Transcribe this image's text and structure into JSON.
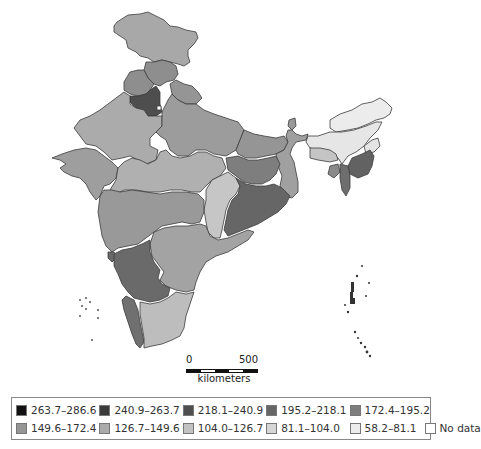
{
  "map": {
    "title": "",
    "region": "India",
    "states": [
      {
        "name": "Jammu and Kashmir",
        "class": "126.7-149.6",
        "color": "#a8a8a8"
      },
      {
        "name": "Himachal Pradesh",
        "class": "149.6-172.4",
        "color": "#8e8e8e"
      },
      {
        "name": "Punjab",
        "class": "149.6-172.4",
        "color": "#8e8e8e"
      },
      {
        "name": "Haryana",
        "class": "218.1-240.9",
        "color": "#4e4e4e"
      },
      {
        "name": "Uttarakhand",
        "class": "149.6-172.4",
        "color": "#959595"
      },
      {
        "name": "Rajasthan",
        "class": "126.7-149.6",
        "color": "#ababab"
      },
      {
        "name": "Uttar Pradesh",
        "class": "149.6-172.4",
        "color": "#9c9c9c"
      },
      {
        "name": "Bihar",
        "class": "149.6-172.4",
        "color": "#959595"
      },
      {
        "name": "Gujarat",
        "class": "149.6-172.4",
        "color": "#9e9e9e"
      },
      {
        "name": "Madhya Pradesh",
        "class": "126.7-149.6",
        "color": "#b0b0b0"
      },
      {
        "name": "Jharkhand",
        "class": "172.4-195.2",
        "color": "#7e7e7e"
      },
      {
        "name": "West Bengal",
        "class": "149.6-172.4",
        "color": "#a0a0a0"
      },
      {
        "name": "Chhattisgarh",
        "class": "104.0-126.7",
        "color": "#c6c6c6"
      },
      {
        "name": "Odisha",
        "class": "195.2-218.1",
        "color": "#666666"
      },
      {
        "name": "Maharashtra",
        "class": "149.6-172.4",
        "color": "#999999"
      },
      {
        "name": "Andhra Pradesh",
        "class": "149.6-172.4",
        "color": "#a3a3a3"
      },
      {
        "name": "Karnataka",
        "class": "195.2-218.1",
        "color": "#6a6a6a"
      },
      {
        "name": "Goa",
        "class": "195.2-218.1",
        "color": "#6a6a6a"
      },
      {
        "name": "Kerala",
        "class": "195.2-218.1",
        "color": "#707070"
      },
      {
        "name": "Tamil Nadu",
        "class": "104.0-126.7",
        "color": "#bdbdbd"
      },
      {
        "name": "Sikkim",
        "class": "149.6-172.4",
        "color": "#999999"
      },
      {
        "name": "Arunachal Pradesh",
        "class": "58.2-81.1",
        "color": "#ececec"
      },
      {
        "name": "Assam",
        "class": "58.2-81.1",
        "color": "#e6e6e6"
      },
      {
        "name": "Meghalaya",
        "class": "104.0-126.7",
        "color": "#c4c4c4"
      },
      {
        "name": "Nagaland",
        "class": "58.2-81.1",
        "color": "#e4e4e4"
      },
      {
        "name": "Manipur",
        "class": "195.2-218.1",
        "color": "#626262"
      },
      {
        "name": "Mizoram",
        "class": "195.2-218.1",
        "color": "#6e6e6e"
      },
      {
        "name": "Tripura",
        "class": "172.4-195.2",
        "color": "#8a8a8a"
      },
      {
        "name": "Delhi",
        "class": "No data",
        "color": "#ffffff"
      }
    ]
  },
  "scale_bar": {
    "start_label": "0",
    "end_label": "500",
    "unit_label": "kilometers"
  },
  "legend": {
    "items": [
      {
        "label": "263.7–286.6",
        "color": "#111111"
      },
      {
        "label": "240.9–263.7",
        "color": "#3a3a3a"
      },
      {
        "label": "218.1–240.9",
        "color": "#4e4e4e"
      },
      {
        "label": "195.2–218.1",
        "color": "#666666"
      },
      {
        "label": "172.4–195.2",
        "color": "#7e7e7e"
      },
      {
        "label": "149.6–172.4",
        "color": "#959595"
      },
      {
        "label": "126.7–149.6",
        "color": "#ababab"
      },
      {
        "label": "104.0–126.7",
        "color": "#c2c2c2"
      },
      {
        "label": "81.1–104.0",
        "color": "#d6d6d6"
      },
      {
        "label": "58.2–81.1",
        "color": "#ececec"
      },
      {
        "label": "No data",
        "color": "#ffffff"
      }
    ]
  }
}
